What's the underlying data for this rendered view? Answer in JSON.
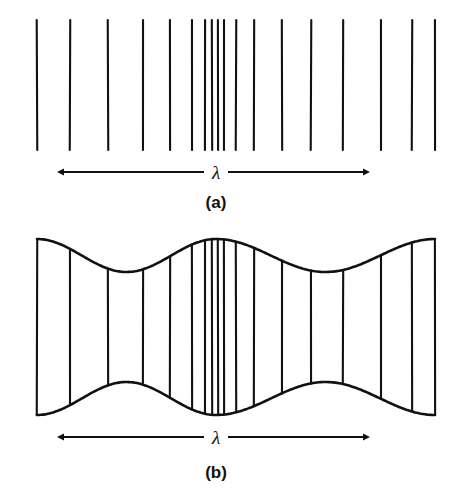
{
  "figure": {
    "caption_a": "(a)",
    "caption_b": "(b)",
    "lambda_symbol_a": "λ",
    "lambda_symbol_b": "λ",
    "stroke_color": "#111111",
    "background_color": "#ffffff"
  },
  "chart_data": {
    "type": "line",
    "title": "",
    "subtitle": "",
    "xlabel": "",
    "ylabel": "",
    "grid": false,
    "legend": "none",
    "panels": [
      {
        "id": "a",
        "label": "(a)",
        "xlim": [
          0,
          465
        ],
        "ylim": [
          0,
          503
        ],
        "line_top_y": 20,
        "line_bottom_y": 150,
        "wavefront_x": [
          37,
          70,
          108,
          143,
          170,
          192,
          205,
          212,
          218,
          224,
          236,
          254,
          282,
          311,
          343,
          381,
          412,
          435
        ],
        "envelope": null,
        "lambda_marker": {
          "symbol": "λ",
          "y": 172,
          "x_start": 57,
          "x_end": 370,
          "label_x": 216,
          "label_y": 179
        },
        "caption": {
          "text": "(a)",
          "x": 216,
          "y": 208
        }
      },
      {
        "id": "b",
        "label": "(b)",
        "xlim": [
          0,
          465
        ],
        "ylim": [
          0,
          503
        ],
        "line_top_y": 240,
        "line_bottom_y": 415,
        "wavefront_x": [
          37,
          70,
          108,
          143,
          170,
          192,
          205,
          212,
          218,
          224,
          236,
          254,
          282,
          311,
          343,
          381,
          412,
          435
        ],
        "envelope": {
          "type": "sinusoidal",
          "max_half_height": 88,
          "min_half_height": 55,
          "center_y": 327,
          "antinodes_x": [
            37,
            216,
            435
          ],
          "nodes_x": [
            95,
            330
          ]
        },
        "lambda_marker": {
          "symbol": "λ",
          "y": 437,
          "x_start": 57,
          "x_end": 370,
          "label_x": 216,
          "label_y": 444
        },
        "caption": {
          "text": "(b)",
          "x": 216,
          "y": 478
        }
      }
    ]
  }
}
